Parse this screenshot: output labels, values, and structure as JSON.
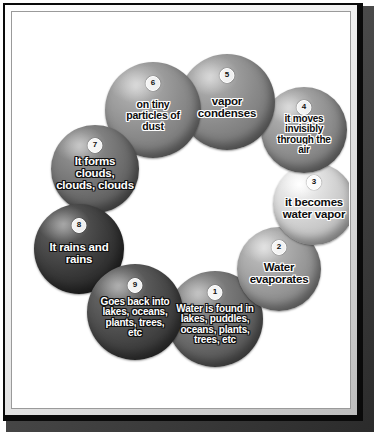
{
  "poster": {
    "frame_colors": {
      "outer_border": "#0a0a0a",
      "bevel_light": "#ffffff",
      "bevel_shadow": "#2b2b2b",
      "canvas_background": "#ffffff"
    }
  },
  "chart_data": {
    "type": "diagram",
    "diagram_kind": "cycle",
    "title": "",
    "node_count": 9,
    "direction": "clockwise",
    "nodes": [
      {
        "number": "1",
        "label": "Water is found in\nlakes, puddles,\noceans, plants,\ntrees, etc",
        "tone": "mid-dark",
        "fill": "#6a6a6a",
        "x": 202,
        "y": 306,
        "r": 48
      },
      {
        "number": "2",
        "label": "Water\nevaporates",
        "tone": "mid",
        "fill": "#9a9a9a",
        "x": 266,
        "y": 256,
        "r": 42
      },
      {
        "number": "3",
        "label": "it becomes\nwater vapor",
        "tone": "light",
        "fill": "#cfcfcf",
        "x": 301,
        "y": 191,
        "r": 41
      },
      {
        "number": "4",
        "label": "it moves\ninvisibly\nthrough the\nair",
        "tone": "mid",
        "fill": "#8f8f8f",
        "x": 291,
        "y": 117,
        "r": 43
      },
      {
        "number": "5",
        "label": "vapor\ncondenses",
        "tone": "mid",
        "fill": "#8a8a8a",
        "x": 214,
        "y": 89,
        "r": 48
      },
      {
        "number": "6",
        "label": "on tiny\nparticles of\ndust",
        "tone": "mid",
        "fill": "#8c8c8c",
        "x": 140,
        "y": 97,
        "r": 48
      },
      {
        "number": "7",
        "label": "It forms clouds,\nclouds, clouds",
        "tone": "mid-dark",
        "fill": "#707070",
        "x": 82,
        "y": 156,
        "r": 44
      },
      {
        "number": "8",
        "label": "It rains and\nrains",
        "tone": "dark",
        "fill": "#3c3c3c",
        "x": 66,
        "y": 236,
        "r": 45
      },
      {
        "number": "9",
        "label": "Goes back into\nlakes, oceans,\nplants, trees,\netc",
        "tone": "dark",
        "fill": "#4a4a4a",
        "x": 122,
        "y": 299,
        "r": 48
      }
    ],
    "connectors": [
      {
        "from": "1",
        "to": "2"
      },
      {
        "from": "2",
        "to": "3"
      },
      {
        "from": "3",
        "to": "4"
      },
      {
        "from": "4",
        "to": "5"
      },
      {
        "from": "5",
        "to": "6"
      },
      {
        "from": "6",
        "to": "7"
      },
      {
        "from": "7",
        "to": "8"
      },
      {
        "from": "8",
        "to": "9"
      },
      {
        "from": "9",
        "to": "1"
      }
    ]
  }
}
